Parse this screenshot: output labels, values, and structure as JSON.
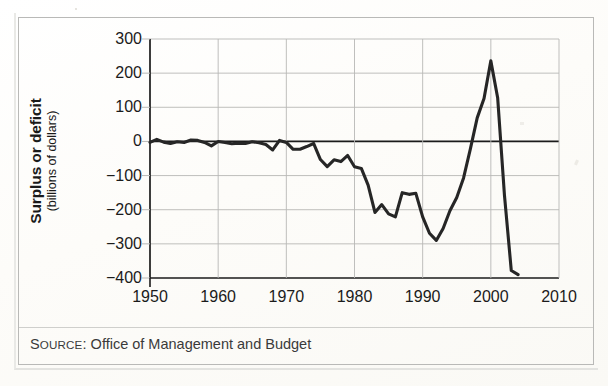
{
  "figure": {
    "source_prefix_lead": "S",
    "source_prefix_rest": "OURCE",
    "source_colon": ":",
    "source_text": " Office of Management and Budget"
  },
  "chart_data": {
    "type": "line",
    "title": "",
    "xlabel": "",
    "ylabel": "Surplus or deficit",
    "ylabel_sub": "(billions of dollars)",
    "xlim": [
      1950,
      2010
    ],
    "ylim": [
      -400,
      300
    ],
    "xticks": [
      1950,
      1960,
      1970,
      1980,
      1990,
      2000,
      2010
    ],
    "xtick_labels": [
      "1950",
      "1960",
      "1970",
      "1980",
      "1990",
      "2000",
      "2010"
    ],
    "yticks": [
      300,
      200,
      100,
      0,
      -100,
      -200,
      -300,
      -400
    ],
    "ytick_labels": [
      "300",
      "200",
      "100",
      "0",
      "−100",
      "−200",
      "−300",
      "−400"
    ],
    "grid": true,
    "legend": "none",
    "line_color": "#262626",
    "grid_color": "#b8b8b6",
    "axis_color": "#1b1b1b",
    "zero_line": 0,
    "x": [
      1950,
      1951,
      1952,
      1953,
      1954,
      1955,
      1956,
      1957,
      1958,
      1959,
      1960,
      1961,
      1962,
      1963,
      1964,
      1965,
      1966,
      1967,
      1968,
      1969,
      1970,
      1971,
      1972,
      1973,
      1974,
      1975,
      1976,
      1977,
      1978,
      1979,
      1980,
      1981,
      1982,
      1983,
      1984,
      1985,
      1986,
      1987,
      1988,
      1989,
      1990,
      1991,
      1992,
      1993,
      1994,
      1995,
      1996,
      1997,
      1998,
      1999,
      2000,
      2001,
      2002,
      2003,
      2004
    ],
    "values": [
      -3,
      6,
      -2,
      -6,
      -1,
      -3,
      4,
      3,
      -3,
      -13,
      0,
      -3,
      -7,
      -5,
      -6,
      -1,
      -4,
      -9,
      -25,
      3,
      -3,
      -23,
      -23,
      -15,
      -6,
      -53,
      -74,
      -54,
      -59,
      -41,
      -74,
      -79,
      -128,
      -208,
      -185,
      -212,
      -221,
      -150,
      -155,
      -152,
      -221,
      -269,
      -290,
      -255,
      -203,
      -164,
      -107,
      -22,
      69,
      126,
      236,
      128,
      -158,
      -378,
      -390
    ]
  }
}
